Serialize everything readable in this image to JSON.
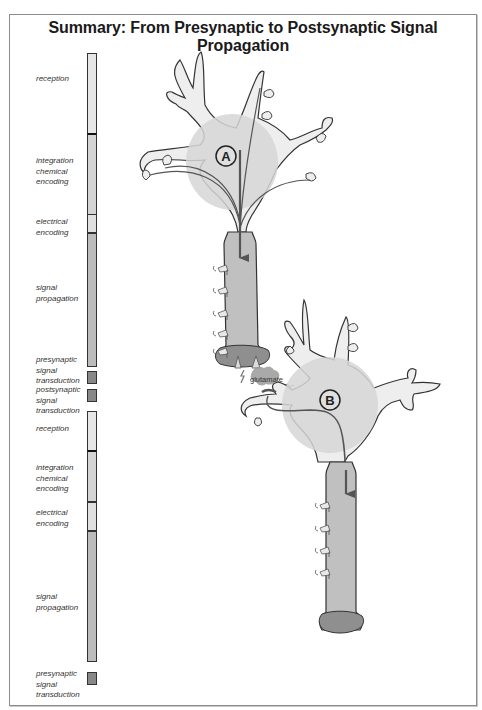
{
  "title": "Summary: From Presynaptic to Postsynaptic Signal Propagation",
  "stages": [
    {
      "label": "reception",
      "top": 53,
      "height": 81,
      "color": "#e6e6e6",
      "label_top": 77
    },
    {
      "label": "integration\nchemical\nencoding",
      "top": 133,
      "height": 82,
      "color": "#d4d4d4",
      "label_top": 156,
      "sep": true
    },
    {
      "label": "electrical\nencoding",
      "top": 214,
      "height": 19,
      "color": "#e0e0e0",
      "label_top": 219
    },
    {
      "label": "signal\npropagation",
      "top": 233,
      "height": 134,
      "color": "#bcbcbc",
      "label_top": 282
    },
    {
      "label": "presynaptic\nsignal\ntransduction",
      "top": 371,
      "height": 13,
      "color": "#888888",
      "label_top": 357
    },
    {
      "label": "postsynaptic\nsignal\ntransduction",
      "top": 389,
      "height": 13,
      "color": "#888888",
      "label_top": 386
    },
    {
      "label": "reception",
      "top": 411,
      "height": 40,
      "color": "#e6e6e6",
      "label_top": 424
    },
    {
      "label": "integration\nchemical\nencoding",
      "top": 450,
      "height": 52,
      "color": "#d4d4d4",
      "label_top": 462,
      "sep": true
    },
    {
      "label": "electrical\nencoding",
      "top": 502,
      "height": 29,
      "color": "#e0e0e0",
      "label_top": 508
    },
    {
      "label": "signal\npropagation",
      "top": 531,
      "height": 131,
      "color": "#bcbcbc",
      "label_top": 592
    },
    {
      "label": "presynaptic\nsignal\ntransduction",
      "top": 672,
      "height": 13,
      "color": "#888888",
      "label_top": 668
    }
  ],
  "neurons": [
    {
      "id": "A",
      "label": "A"
    },
    {
      "id": "B",
      "label": "B"
    }
  ],
  "synapse": {
    "neurotransmitter_label": "glutamate"
  },
  "colors": {
    "dendrite_fill": "#eeeeee",
    "soma_fill": "#d9d9d9",
    "axon_fill": "#bfbfbf",
    "terminal_fill": "#8f8f8f",
    "outline": "#333333",
    "signal_arrow": "#555555"
  }
}
